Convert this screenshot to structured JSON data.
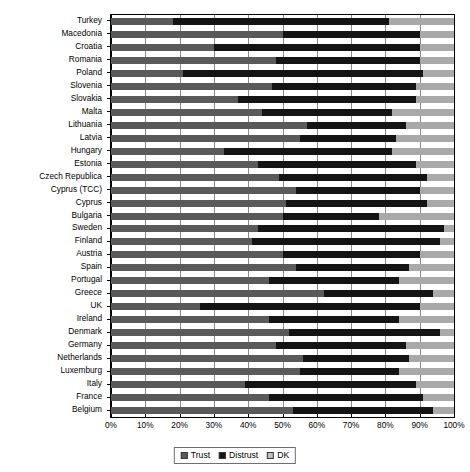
{
  "chart_data": {
    "type": "bar",
    "orientation": "horizontal",
    "stacked": true,
    "title": "",
    "subtitle": "",
    "xlabel": "",
    "ylabel": "",
    "xlim": [
      0,
      100
    ],
    "xticks": [
      "0%",
      "10%",
      "20%",
      "30%",
      "40%",
      "50%",
      "60%",
      "70%",
      "80%",
      "90%",
      "100%"
    ],
    "xtick_values": [
      0,
      10,
      20,
      30,
      40,
      50,
      60,
      70,
      80,
      90,
      100
    ],
    "grid": true,
    "legend_position": "bottom-center",
    "legend": [
      "Trust",
      "Distrust",
      "DK"
    ],
    "colors": {
      "trust": "#5a5a5a",
      "distrust": "#141414",
      "dk": "#a9a9a9"
    },
    "categories": [
      "Turkey",
      "Macedonia",
      "Croatia",
      "Romania",
      "Poland",
      "Slovenia",
      "Slovakia",
      "Malta",
      "Lithuania",
      "Latvia",
      "Hungary",
      "Estonia",
      "Czech Republica",
      "Cyprus (TCC)",
      "Cyprus",
      "Bulgaria",
      "Sweden",
      "Finland",
      "Austria",
      "Spain",
      "Portugal",
      "Greece",
      "UK",
      "Ireland",
      "Denmark",
      "Germany",
      "Netherlands",
      "Luxemburg",
      "Italy",
      "France",
      "Belgium"
    ],
    "series": [
      {
        "name": "Trust",
        "values": [
          18,
          50,
          30,
          48,
          21,
          47,
          37,
          44,
          57,
          55,
          33,
          43,
          49,
          54,
          51,
          50,
          43,
          41,
          50,
          54,
          46,
          62,
          26,
          46,
          52,
          48,
          56,
          55,
          39,
          46,
          53
        ]
      },
      {
        "name": "Distrust",
        "values": [
          63,
          40,
          60,
          42,
          70,
          42,
          52,
          38,
          29,
          28,
          49,
          46,
          43,
          36,
          41,
          28,
          54,
          55,
          40,
          33,
          38,
          32,
          64,
          38,
          44,
          38,
          31,
          29,
          50,
          45,
          41
        ]
      },
      {
        "name": "DK",
        "values": [
          19,
          10,
          10,
          10,
          9,
          11,
          11,
          18,
          14,
          17,
          18,
          11,
          8,
          10,
          8,
          22,
          3,
          4,
          10,
          13,
          16,
          6,
          10,
          16,
          4,
          14,
          13,
          16,
          11,
          9,
          6
        ]
      }
    ]
  }
}
